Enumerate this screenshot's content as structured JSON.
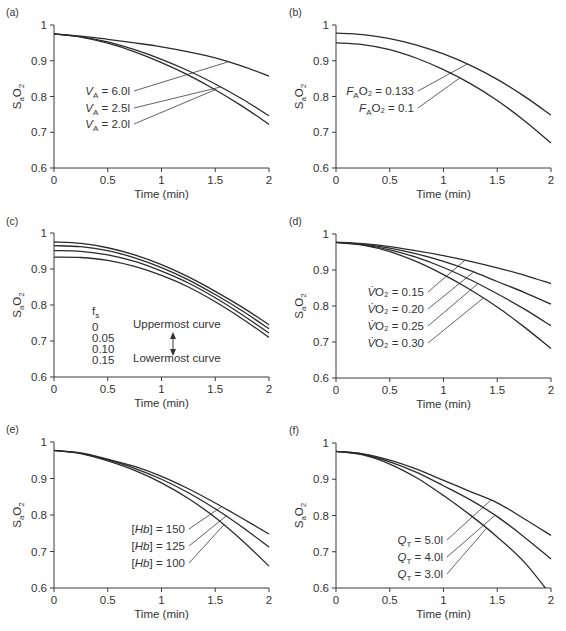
{
  "chart_data": [
    {
      "panel": "(a)",
      "type": "line",
      "xlabel": "Time (min)",
      "ylabel": "SaO2",
      "xlim": [
        0,
        2
      ],
      "ylim": [
        0.6,
        1
      ],
      "xticks": [
        "0",
        "0.5",
        "1",
        "1.5",
        "2"
      ],
      "yticks": [
        "0.6",
        "0.7",
        "0.8",
        "0.9",
        "1"
      ],
      "x": [
        0,
        0.25,
        0.5,
        0.75,
        1,
        1.25,
        1.5,
        1.75,
        2
      ],
      "series": [
        {
          "name": "VA = 6.0l",
          "label_main": "V",
          "label_sub": "A",
          "label_rest": " = 6.0l",
          "values": [
            0.975,
            0.969,
            0.96,
            0.95,
            0.939,
            0.925,
            0.908,
            0.885,
            0.857
          ],
          "label_anchor_t": 1.62
        },
        {
          "name": "VA = 2.5l",
          "label_main": "V",
          "label_sub": "A",
          "label_rest": " = 2.5l",
          "values": [
            0.975,
            0.967,
            0.953,
            0.931,
            0.904,
            0.872,
            0.835,
            0.793,
            0.746
          ],
          "label_anchor_t": 1.55
        },
        {
          "name": "VA = 2.0l",
          "label_main": "V",
          "label_sub": "A",
          "label_rest": " = 2.0l",
          "values": [
            0.975,
            0.966,
            0.949,
            0.925,
            0.895,
            0.86,
            0.819,
            0.773,
            0.722
          ],
          "label_anchor_t": 1.5
        }
      ]
    },
    {
      "panel": "(b)",
      "type": "line",
      "xlabel": "Time (min)",
      "ylabel": "SaO2",
      "xlim": [
        0,
        2
      ],
      "ylim": [
        0.6,
        1
      ],
      "xticks": [
        "0",
        "0.5",
        "1",
        "1.5",
        "2"
      ],
      "yticks": [
        "0.6",
        "0.7",
        "0.8",
        "0.9",
        "1"
      ],
      "x": [
        0,
        0.25,
        0.5,
        0.75,
        1,
        1.25,
        1.5,
        1.75,
        2
      ],
      "series": [
        {
          "name": "FAO2 = 0.133",
          "label_main": "F",
          "label_sub": "A",
          "label_rest": "O₂ = 0.133",
          "values": [
            0.977,
            0.973,
            0.962,
            0.944,
            0.919,
            0.887,
            0.848,
            0.801,
            0.748
          ],
          "label_anchor_t": 1.22
        },
        {
          "name": "FAO2 = 0.1",
          "label_main": "F",
          "label_sub": "A",
          "label_rest": "O₂ = 0.1",
          "values": [
            0.95,
            0.945,
            0.931,
            0.907,
            0.875,
            0.836,
            0.789,
            0.733,
            0.67
          ],
          "label_anchor_t": 1.15
        }
      ]
    },
    {
      "panel": "(c)",
      "type": "line",
      "xlabel": "Time (min)",
      "ylabel": "SaO2",
      "xlim": [
        0,
        2
      ],
      "ylim": [
        0.6,
        1
      ],
      "xticks": [
        "0",
        "0.5",
        "1",
        "1.5",
        "2"
      ],
      "yticks": [
        "0.6",
        "0.7",
        "0.8",
        "0.9",
        "1"
      ],
      "x": [
        0,
        0.25,
        0.5,
        0.75,
        1,
        1.25,
        1.5,
        1.75,
        2
      ],
      "legend": {
        "title": "fs",
        "entries": [
          "0",
          "0.05",
          "0.10",
          "0.15"
        ],
        "upper_note": "Uppermost curve",
        "lower_note": "Lowermost curve"
      },
      "series": [
        {
          "name": "fs = 0",
          "values": [
            0.975,
            0.971,
            0.959,
            0.939,
            0.912,
            0.878,
            0.838,
            0.794,
            0.745
          ]
        },
        {
          "name": "fs = 0.05",
          "values": [
            0.965,
            0.962,
            0.951,
            0.931,
            0.904,
            0.87,
            0.829,
            0.784,
            0.734
          ]
        },
        {
          "name": "fs = 0.10",
          "values": [
            0.951,
            0.949,
            0.939,
            0.921,
            0.894,
            0.861,
            0.82,
            0.773,
            0.722
          ]
        },
        {
          "name": "fs = 0.15",
          "values": [
            0.933,
            0.932,
            0.924,
            0.907,
            0.882,
            0.85,
            0.809,
            0.762,
            0.71
          ]
        }
      ]
    },
    {
      "panel": "(d)",
      "type": "line",
      "xlabel": "Time (min)",
      "ylabel": "SaO2",
      "xlim": [
        0,
        2
      ],
      "ylim": [
        0.6,
        1
      ],
      "xticks": [
        "0",
        "0.5",
        "1",
        "1.5",
        "2"
      ],
      "yticks": [
        "0.6",
        "0.7",
        "0.8",
        "0.9",
        "1"
      ],
      "x": [
        0,
        0.25,
        0.5,
        0.75,
        1,
        1.25,
        1.5,
        1.75,
        2
      ],
      "series": [
        {
          "name": "VO2 = 0.15",
          "label_main": "V̇",
          "label_sub": "",
          "label_rest": "O₂ = 0.15",
          "values": [
            0.977,
            0.973,
            0.965,
            0.953,
            0.94,
            0.924,
            0.906,
            0.886,
            0.862
          ],
          "label_anchor_t": 1.2
        },
        {
          "name": "VO2 = 0.20",
          "label_main": "V̇",
          "label_sub": "",
          "label_rest": "O₂ = 0.20",
          "values": [
            0.977,
            0.972,
            0.961,
            0.945,
            0.924,
            0.898,
            0.868,
            0.838,
            0.805
          ],
          "label_anchor_t": 1.28
        },
        {
          "name": "VO2 = 0.25",
          "label_main": "V̇",
          "label_sub": "",
          "label_rest": "O₂ = 0.25",
          "values": [
            0.977,
            0.97,
            0.956,
            0.935,
            0.907,
            0.873,
            0.834,
            0.792,
            0.745
          ],
          "label_anchor_t": 1.32
        },
        {
          "name": "VO2 = 0.30",
          "label_main": "V̇",
          "label_sub": "",
          "label_rest": "O₂ = 0.30",
          "values": [
            0.977,
            0.969,
            0.951,
            0.923,
            0.887,
            0.845,
            0.797,
            0.742,
            0.682
          ],
          "label_anchor_t": 1.37
        }
      ]
    },
    {
      "panel": "(e)",
      "type": "line",
      "xlabel": "Time (min)",
      "ylabel": "SaO2",
      "xlim": [
        0,
        2
      ],
      "ylim": [
        0.6,
        1
      ],
      "xticks": [
        "0",
        "0.5",
        "1",
        "1.5",
        "2"
      ],
      "yticks": [
        "0.6",
        "0.7",
        "0.8",
        "0.9",
        "1"
      ],
      "x": [
        0,
        0.25,
        0.5,
        0.75,
        1,
        1.25,
        1.5,
        1.75,
        2
      ],
      "series": [
        {
          "name": "[Hb] = 150",
          "label_main": "[Hb]",
          "label_sub": "",
          "label_rest": " = 150",
          "values": [
            0.977,
            0.97,
            0.953,
            0.933,
            0.906,
            0.872,
            0.833,
            0.791,
            0.748
          ],
          "label_anchor_t": 1.56
        },
        {
          "name": "[Hb] = 125",
          "label_main": "[Hb]",
          "label_sub": "",
          "label_rest": " = 125",
          "values": [
            0.977,
            0.969,
            0.951,
            0.928,
            0.898,
            0.861,
            0.817,
            0.767,
            0.712
          ],
          "label_anchor_t": 1.6
        },
        {
          "name": "[Hb] = 100",
          "label_main": "[Hb]",
          "label_sub": "",
          "label_rest": " = 100",
          "values": [
            0.977,
            0.968,
            0.948,
            0.922,
            0.888,
            0.845,
            0.793,
            0.73,
            0.66
          ],
          "label_anchor_t": 1.58
        }
      ]
    },
    {
      "panel": "(f)",
      "type": "line",
      "xlabel": "Time (min)",
      "ylabel": "SaO2",
      "xlim": [
        0,
        2
      ],
      "ylim": [
        0.6,
        1
      ],
      "xticks": [
        "0",
        "0.5",
        "1",
        "1.5",
        "2"
      ],
      "yticks": [
        "0.6",
        "0.7",
        "0.8",
        "0.9",
        "1"
      ],
      "x": [
        0,
        0.25,
        0.5,
        0.75,
        1,
        1.25,
        1.5,
        1.75,
        2
      ],
      "series": [
        {
          "name": "QT = 5.0l",
          "label_main": "Q",
          "label_sub": "T",
          "label_rest": " = 5.0l",
          "values": [
            0.977,
            0.97,
            0.953,
            0.928,
            0.897,
            0.866,
            0.835,
            0.791,
            0.745
          ],
          "label_anchor_t": 1.44
        },
        {
          "name": "QT = 4.0l",
          "label_main": "Q",
          "label_sub": "T",
          "label_rest": " = 4.0l",
          "values": [
            0.977,
            0.969,
            0.948,
            0.919,
            0.882,
            0.843,
            0.797,
            0.741,
            0.68
          ],
          "label_anchor_t": 1.48
        },
        {
          "name": "QT = 3.0l",
          "label_main": "Q",
          "label_sub": "T",
          "label_rest": " = 3.0l",
          "values": [
            0.977,
            0.967,
            0.942,
            0.904,
            0.855,
            0.801,
            0.741,
            0.672,
            0.58
          ],
          "label_anchor_t": 1.4
        }
      ]
    }
  ],
  "layout": {
    "panels": [
      {
        "ox": 54,
        "oy": 25,
        "w": 215,
        "h": 143,
        "label_x": 6,
        "label_y": 12,
        "labels_x": 130,
        "labels_y": [
          91,
          108,
          124
        ]
      },
      {
        "ox": 336,
        "oy": 25,
        "w": 215,
        "h": 143,
        "label_x": 289,
        "label_y": 12,
        "labels_x": 414,
        "labels_y": [
          91,
          108
        ]
      },
      {
        "ox": 54,
        "oy": 233,
        "w": 215,
        "h": 144
      },
      {
        "ox": 336,
        "oy": 234,
        "w": 215,
        "h": 144,
        "label_x": 289,
        "label_y": 221,
        "labels_x": 424,
        "labels_y": [
          292,
          309,
          326,
          343
        ]
      },
      {
        "ox": 54,
        "oy": 442,
        "w": 215,
        "h": 146,
        "label_x": 6,
        "label_y": 429,
        "labels_x": 185,
        "labels_y": [
          529,
          546,
          563
        ]
      },
      {
        "ox": 336,
        "oy": 443,
        "w": 215,
        "h": 145,
        "label_x": 289,
        "label_y": 430,
        "labels_x": 443,
        "labels_y": [
          540,
          557,
          574
        ]
      }
    ]
  }
}
